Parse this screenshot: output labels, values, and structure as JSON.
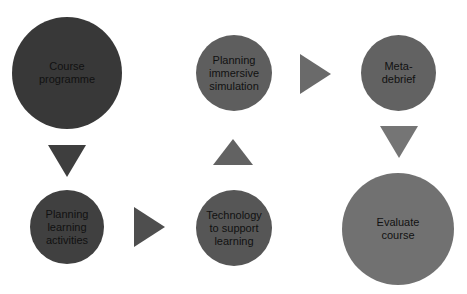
{
  "diagram": {
    "type": "process-flow",
    "nodes": [
      {
        "id": "course-programme",
        "label": "Course\nprogramme",
        "color": "#383838"
      },
      {
        "id": "planning-learning-activities",
        "label": "Planning\nlearning\nactivities",
        "color": "#404040"
      },
      {
        "id": "technology-to-support-learning",
        "label": "Technology\nto support\nlearning",
        "color": "#565656"
      },
      {
        "id": "planning-immersive-simulation",
        "label": "Planning\nimmersive\nsimulation",
        "color": "#5e5e5e"
      },
      {
        "id": "meta-debrief",
        "label": "Meta-\ndebrief",
        "color": "#626262"
      },
      {
        "id": "evaluate-course",
        "label": "Evaluate\ncourse",
        "color": "#717171"
      }
    ],
    "arrows": [
      {
        "from": "course-programme",
        "to": "planning-learning-activities",
        "direction": "down",
        "color": "#3e3e3e"
      },
      {
        "from": "planning-learning-activities",
        "to": "technology-to-support-learning",
        "direction": "right",
        "color": "#4e4e4e"
      },
      {
        "from": "technology-to-support-learning",
        "to": "planning-immersive-simulation",
        "direction": "up",
        "color": "#626262"
      },
      {
        "from": "planning-immersive-simulation",
        "to": "meta-debrief",
        "direction": "right",
        "color": "#6a6a6a"
      },
      {
        "from": "meta-debrief",
        "to": "evaluate-course",
        "direction": "down",
        "color": "#757575"
      }
    ]
  }
}
